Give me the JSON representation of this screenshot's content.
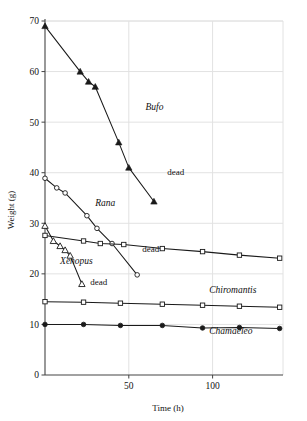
{
  "chart_data": {
    "type": "line",
    "title": "",
    "xlabel": "Time (h)",
    "ylabel": "Weight (g)",
    "xlim": [
      0,
      142
    ],
    "ylim": [
      0,
      70
    ],
    "xticks": [
      50,
      100
    ],
    "yticks": [
      0,
      10,
      20,
      30,
      40,
      50,
      60,
      70
    ],
    "grid": true,
    "legend_position": "inline-annotations",
    "series": [
      {
        "name": "Bufo",
        "marker": "filled-triangle",
        "x": [
          0,
          21,
          26,
          30,
          44,
          50,
          65
        ],
        "y": [
          69.0,
          60.0,
          58.0,
          57.0,
          46.0,
          41.0,
          34.3
        ],
        "label_x": 60,
        "label_y": 52.5,
        "annotation": "dead",
        "annotation_x": 73,
        "annotation_y": 39.5
      },
      {
        "name": "Rana",
        "marker": "open-circle",
        "x": [
          0,
          7,
          12,
          25,
          31,
          40,
          55
        ],
        "y": [
          38.9,
          37.0,
          36.0,
          31.5,
          29.0,
          26.0,
          19.8
        ],
        "label_x": 30,
        "label_y": 33.5,
        "annotation": "dead",
        "annotation_x": 58,
        "annotation_y": 24.3
      },
      {
        "name": "Xenopus",
        "marker": "open-triangle",
        "x": [
          0,
          5,
          9,
          12,
          15,
          22
        ],
        "y": [
          29.5,
          26.5,
          25.5,
          24.7,
          23.6,
          18.0
        ],
        "label_x": 9,
        "label_y": 22.0,
        "annotation": "dead",
        "annotation_x": 27,
        "annotation_y": 17.8
      },
      {
        "name": "Chiromantis",
        "marker": "open-square",
        "x": [
          0,
          23,
          33,
          47,
          70,
          94,
          116,
          140
        ],
        "y": [
          27.6,
          26.5,
          26.0,
          25.8,
          25.0,
          24.4,
          23.7,
          23.1
        ],
        "label_x": 0,
        "label_y": 0,
        "annotation": "",
        "annotation_x": 0,
        "annotation_y": 0
      },
      {
        "name": "Chiromantis-low",
        "marker": "open-square",
        "x": [
          0,
          23,
          45,
          70,
          94,
          116,
          140
        ],
        "y": [
          14.5,
          14.4,
          14.2,
          14.0,
          13.8,
          13.6,
          13.4
        ],
        "label_x": 98,
        "label_y": 16.3,
        "annotation": "",
        "annotation_x": 0,
        "annotation_y": 0
      },
      {
        "name": "Chamaeleo",
        "marker": "filled-circle",
        "x": [
          0,
          23,
          45,
          70,
          94,
          116,
          140
        ],
        "y": [
          10.0,
          10.0,
          9.8,
          9.8,
          9.3,
          9.4,
          9.2
        ],
        "label_x": 98,
        "label_y": 8.1,
        "annotation": "",
        "annotation_x": 0,
        "annotation_y": 0
      }
    ]
  },
  "labels": {
    "y_axis": "Weight (g)",
    "x_axis": "Time (h)",
    "bufo": "Bufo",
    "rana": "Rana",
    "xenopus": "Xenopus",
    "chiromantis": "Chiromantis",
    "chamaeleo": "Chamaeleo",
    "dead": "dead"
  },
  "colors": {
    "line": "#1a1a1a",
    "grid": "#e2e2e2",
    "axis": "#444444",
    "background": "#ffffff",
    "marker_fill_open": "#ffffff"
  }
}
